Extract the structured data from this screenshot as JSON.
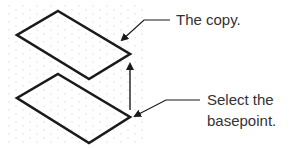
{
  "labels": {
    "copy": "The copy.",
    "basepoint_line1": "Select the",
    "basepoint_line2": "basepoint."
  },
  "colors": {
    "stroke": "#1a1a1a",
    "text": "#333333",
    "grid_dot": "#d8d8d8"
  }
}
